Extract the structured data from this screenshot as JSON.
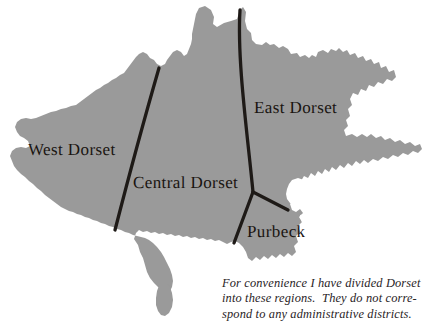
{
  "figure": {
    "name": "map-of-dorset-regions",
    "background_color": "#ffffff",
    "land_fill_color": "#9a9a9a",
    "boundary_line_color": "#1e1a17",
    "label_text_color": "#191410"
  },
  "regions": [
    {
      "id": "west-dorset",
      "label": "West Dorset"
    },
    {
      "id": "central-dorset",
      "label": "Central Dorset"
    },
    {
      "id": "east-dorset",
      "label": "East Dorset"
    },
    {
      "id": "purbeck",
      "label": "Purbeck"
    }
  ],
  "caption": {
    "lines": [
      "For convenience I have divided Dorset",
      "into these regions.  They do not corre-",
      "spond to any administrative districts."
    ],
    "full_text": "For convenience I have divided Dorset into these regions. They do not correspond to any administrative districts."
  }
}
